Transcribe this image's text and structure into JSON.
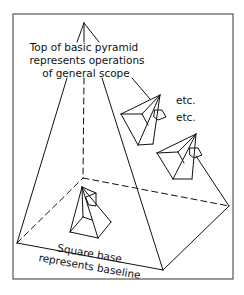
{
  "diagram": {
    "apex_label": {
      "line1": "Top of basic pyramid",
      "line2": "represents operations",
      "line3": "of general scope"
    },
    "base_label": {
      "line1": "Square base",
      "line2": "represents baseline"
    },
    "etc_labels": [
      "etc.",
      "etc."
    ],
    "colors": {
      "line": "#111111",
      "frame": "#555555",
      "background": "#ffffff"
    }
  }
}
